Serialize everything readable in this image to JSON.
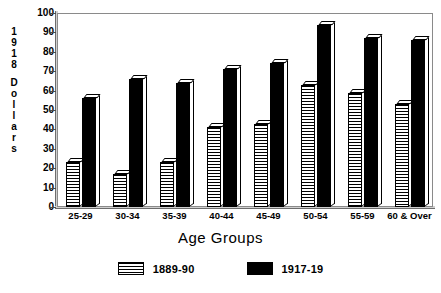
{
  "chart_data": {
    "type": "bar",
    "title": "",
    "xlabel": "Age Groups",
    "ylabel": "1918 Dollars",
    "categories": [
      "25-29",
      "30-34",
      "35-39",
      "40-44",
      "45-49",
      "50-54",
      "55-59",
      "60 & Over"
    ],
    "series": [
      {
        "name": "1889-90",
        "pattern": "horizontal-hatch",
        "color": "#ffffff",
        "values": [
          23,
          17,
          23,
          41,
          43,
          63,
          59,
          53
        ]
      },
      {
        "name": "1917-19",
        "pattern": "solid",
        "color": "#000000",
        "values": [
          56,
          66,
          64,
          71,
          74,
          94,
          87,
          86
        ]
      }
    ],
    "ylim": [
      0,
      100
    ],
    "yticks": [
      0,
      10,
      20,
      30,
      40,
      50,
      60,
      70,
      80,
      90,
      100
    ],
    "ytick_labels": [
      "0",
      "10",
      "20",
      "30",
      "40",
      "50",
      "60",
      "70",
      "80",
      "90",
      "100"
    ],
    "grid": false,
    "legend_position": "bottom-center",
    "legend_entries": [
      "1889-90",
      "1917-19"
    ]
  },
  "axes": {
    "y_title_chars": [
      "1",
      "9",
      "1",
      "8",
      "",
      "D",
      "o",
      "l",
      "l",
      "a",
      "r",
      "s"
    ]
  }
}
